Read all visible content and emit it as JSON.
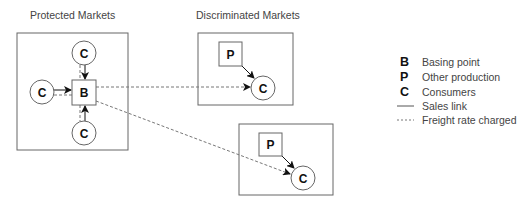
{
  "diagram": {
    "titles": {
      "protected": "Protected Markets",
      "discriminated": "Discriminated Markets"
    },
    "nodes": {
      "basing": "B",
      "production": "P",
      "consumer": "C"
    },
    "legend": [
      {
        "key": "B",
        "label": "Basing point"
      },
      {
        "key": "P",
        "label": "Other production"
      },
      {
        "key": "C",
        "label": "Consumers"
      },
      {
        "key": "solid-line",
        "label": "Sales link"
      },
      {
        "key": "dashed-line",
        "label": "Freight rate charged"
      }
    ],
    "colors": {
      "stroke": "#555555",
      "text": "#111111",
      "label": "#444444"
    }
  }
}
